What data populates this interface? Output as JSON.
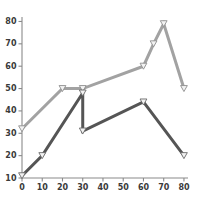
{
  "chart": {
    "title": "",
    "background_color": "#ffffff",
    "axis_color": "#8a8a8a",
    "tick_label_color": "#3a3a3a"
  },
  "chart_data": {
    "type": "line",
    "title": "",
    "subtitle": "",
    "xlabel": "",
    "ylabel": "",
    "xlim": [
      0,
      82
    ],
    "ylim": [
      10,
      82
    ],
    "grid": false,
    "legend": null,
    "xticks": [
      0,
      10,
      20,
      30,
      40,
      50,
      60,
      70,
      80
    ],
    "xtick_labels": [
      "0",
      "10",
      "20",
      "30",
      "40",
      "50",
      "60",
      "70",
      "80"
    ],
    "yticks": [
      10,
      20,
      30,
      40,
      50,
      60,
      70,
      80
    ],
    "ytick_labels": [
      "10",
      "20",
      "30",
      "40",
      "50",
      "60",
      "70",
      "80"
    ],
    "series": [
      {
        "name": "series-light",
        "color": "#a2a2a2",
        "marker": "triangle-down",
        "marker_face_color": "#f2f2f2",
        "marker_edge_color": "#8f8f8f",
        "linewidth": 3,
        "x": [
          0,
          20,
          30,
          60,
          65,
          70,
          80
        ],
        "y": [
          32,
          50,
          50,
          60,
          70,
          79,
          50
        ],
        "points": [
          {
            "x": 0,
            "y": 32
          },
          {
            "x": 20,
            "y": 50
          },
          {
            "x": 30,
            "y": 50
          },
          {
            "x": 60,
            "y": 60
          },
          {
            "x": 65,
            "y": 70
          },
          {
            "x": 70,
            "y": 79
          },
          {
            "x": 80,
            "y": 50
          }
        ]
      },
      {
        "name": "series-dark",
        "color": "#555555",
        "marker": "triangle-down",
        "marker_face_color": "#f2f2f2",
        "marker_edge_color": "#6b6b6b",
        "linewidth": 3,
        "x": [
          0,
          10,
          30,
          30,
          60,
          80
        ],
        "y": [
          11,
          20,
          48,
          31,
          44,
          20
        ],
        "points": [
          {
            "x": 0,
            "y": 11
          },
          {
            "x": 10,
            "y": 20
          },
          {
            "x": 30,
            "y": 48
          },
          {
            "x": 30,
            "y": 31
          },
          {
            "x": 60,
            "y": 44
          },
          {
            "x": 80,
            "y": 20
          }
        ]
      }
    ]
  }
}
